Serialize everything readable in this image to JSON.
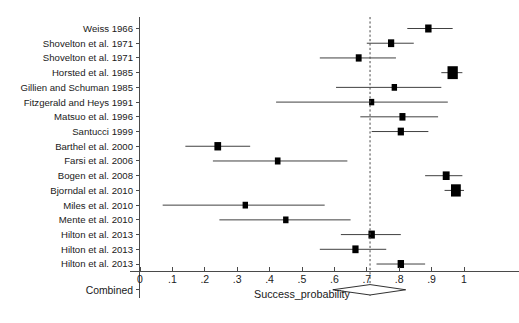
{
  "chart_data": {
    "type": "forest",
    "title": "",
    "xlabel": "Success_probability",
    "ylabel": "",
    "xlim": [
      0,
      1
    ],
    "xticks": [
      0,
      0.1,
      0.2,
      0.3,
      0.4,
      0.5,
      0.6,
      0.7,
      0.8,
      0.9,
      1
    ],
    "xticklabels": [
      "0",
      ".1",
      ".2",
      ".3",
      ".4",
      ".5",
      ".6",
      ".7",
      ".8",
      ".9",
      "1"
    ],
    "grid": false,
    "legend": null,
    "reference_line": 0.71,
    "studies": [
      {
        "label": "Weiss 1966",
        "estimate": 0.89,
        "ci_low": 0.825,
        "ci_high": 0.965,
        "weight": 1.0
      },
      {
        "label": "Shovelton et al. 1971",
        "estimate": 0.775,
        "ci_low": 0.7,
        "ci_high": 0.845,
        "weight": 0.9
      },
      {
        "label": "Shovelton et al. 1971",
        "estimate": 0.675,
        "ci_low": 0.555,
        "ci_high": 0.79,
        "weight": 0.7
      },
      {
        "label": "Horsted et al. 1985",
        "estimate": 0.965,
        "ci_low": 0.93,
        "ci_high": 0.995,
        "weight": 4.6
      },
      {
        "label": "Gillien and Schuman 1985",
        "estimate": 0.785,
        "ci_low": 0.605,
        "ci_high": 0.93,
        "weight": 0.5
      },
      {
        "label": "Fitzgerald and Heys 1991",
        "estimate": 0.715,
        "ci_low": 0.42,
        "ci_high": 0.95,
        "weight": 0.4
      },
      {
        "label": "Matsuo et al. 1996",
        "estimate": 0.81,
        "ci_low": 0.68,
        "ci_high": 0.92,
        "weight": 0.8
      },
      {
        "label": "Santucci 1999",
        "estimate": 0.805,
        "ci_low": 0.715,
        "ci_high": 0.89,
        "weight": 0.9
      },
      {
        "label": "Barthel et al. 2000",
        "estimate": 0.24,
        "ci_low": 0.14,
        "ci_high": 0.34,
        "weight": 1.2
      },
      {
        "label": "Farsi et al. 2006",
        "estimate": 0.425,
        "ci_low": 0.225,
        "ci_high": 0.64,
        "weight": 0.6
      },
      {
        "label": "Bogen et al. 2008",
        "estimate": 0.945,
        "ci_low": 0.88,
        "ci_high": 0.995,
        "weight": 1.3
      },
      {
        "label": "Bjorndal et al. 2010",
        "estimate": 0.975,
        "ci_low": 0.94,
        "ci_high": 1.0,
        "weight": 4.0
      },
      {
        "label": "Miles et al. 2010",
        "estimate": 0.325,
        "ci_low": 0.07,
        "ci_high": 0.57,
        "weight": 0.5
      },
      {
        "label": "Mente et al. 2010",
        "estimate": 0.45,
        "ci_low": 0.245,
        "ci_high": 0.65,
        "weight": 0.5
      },
      {
        "label": "Hilton et al. 2013",
        "estimate": 0.715,
        "ci_low": 0.62,
        "ci_high": 0.805,
        "weight": 1.0
      },
      {
        "label": "Hilton et al. 2013",
        "estimate": 0.665,
        "ci_low": 0.555,
        "ci_high": 0.76,
        "weight": 0.9
      },
      {
        "label": "Hilton et al. 2013",
        "estimate": 0.805,
        "ci_low": 0.73,
        "ci_high": 0.88,
        "weight": 1.0
      }
    ],
    "combined": {
      "label": "Combined",
      "estimate": 0.71,
      "ci_low": 0.595,
      "ci_high": 0.82
    }
  },
  "colors": {
    "marker": "#000000",
    "ci_line": "#2b2b2b",
    "axis": "#4a4a4a",
    "reference_line": "#4a4a4a",
    "diamond_fill": "#ffffff",
    "background": "#ffffff"
  }
}
